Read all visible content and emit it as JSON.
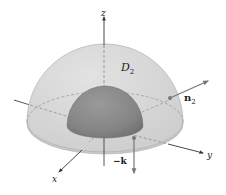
{
  "figure": {
    "type": "3d-surface-diagram",
    "labels": {
      "z_axis": "z",
      "y_axis": "y",
      "x_axis": "x",
      "region": "D",
      "region_subscript": "2",
      "normal": "n",
      "normal_subscript": "2",
      "neg_k": "−k"
    },
    "colors": {
      "outer_dome": "#d9d9d9",
      "outer_dome_edge": "#b5b5b5",
      "inner_hemisphere": "#8f8f8f",
      "inner_hemisphere_dark": "#7a7a7a",
      "base_disk": "#cfcfcf",
      "axis": "#333333",
      "vector": "#777777",
      "background": "#ffffff"
    }
  }
}
